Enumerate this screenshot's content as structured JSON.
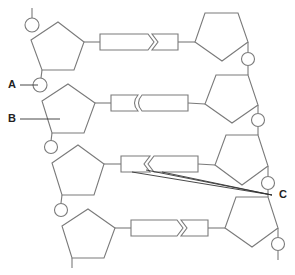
{
  "diagram": {
    "type": "DNA double-helix segment (ladder)",
    "stroke_color": "#7a7a7a",
    "label_color": "#222222",
    "labels": {
      "a": "A",
      "b": "B",
      "c": "C"
    },
    "rows": [
      {
        "left_pentagon": "sugar",
        "connector": "chevron-pointing-right",
        "right_pentagon": "sugar"
      },
      {
        "left_pentagon": "sugar",
        "connector": "double-arc",
        "right_pentagon": "sugar"
      },
      {
        "left_pentagon": "sugar",
        "connector": "chevron-pointing-left",
        "right_pentagon": "sugar"
      },
      {
        "left_pentagon": "sugar",
        "connector": "chevron-pointing-right",
        "right_pentagon": "sugar"
      }
    ],
    "annotations": [
      {
        "label": "A",
        "points_to": "phosphate circle (left strand, between row 1 and 2)"
      },
      {
        "label": "B",
        "points_to": "pentagon sugar (left strand, row 2)"
      },
      {
        "label": "C",
        "points_to": "base pair bonds (row 3)"
      }
    ]
  }
}
